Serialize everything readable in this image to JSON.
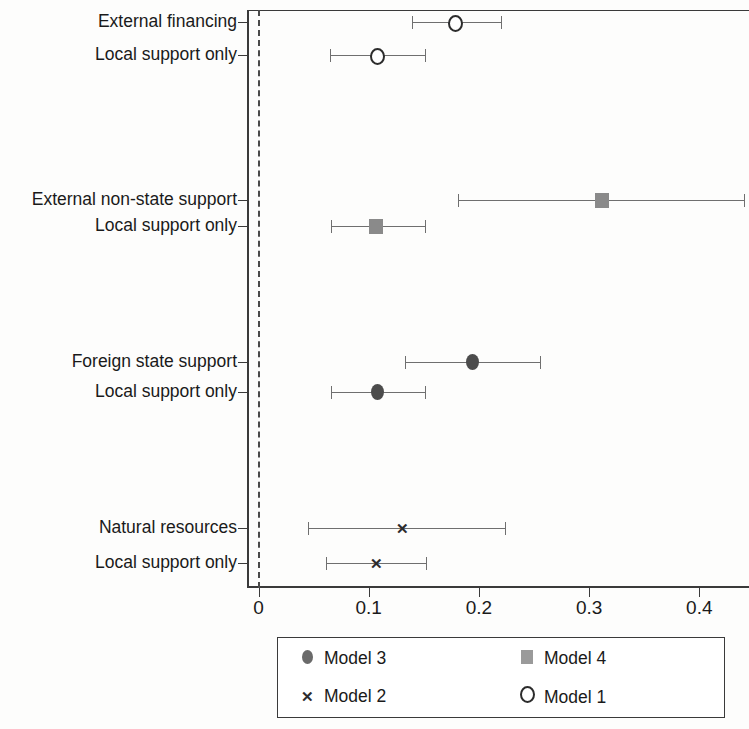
{
  "chart_data": {
    "type": "scatter",
    "title": "",
    "subtitle": "",
    "xlabel": "",
    "ylabel": "",
    "xlim": [
      0.0,
      0.455
    ],
    "grid": false,
    "zero_reference_line": 0.0,
    "x_ticks": [
      {
        "value": 0.0,
        "label": "0"
      },
      {
        "value": 0.1,
        "label": "0.1"
      },
      {
        "value": 0.2,
        "label": "0.2"
      },
      {
        "value": 0.3,
        "label": "0.3"
      },
      {
        "value": 0.4,
        "label": "0.4"
      }
    ],
    "legend": {
      "position": "bottom",
      "entries": [
        {
          "label": "Model 3",
          "marker": "filled-circle",
          "color": "#4c4c4c"
        },
        {
          "label": "Model 4",
          "marker": "filled-square",
          "color": "#8a8a8a"
        },
        {
          "label": "Model 2",
          "marker": "cross",
          "color": "#2c2c2c"
        },
        {
          "label": "Model 1",
          "marker": "open-circle",
          "color": "#2c2c2c"
        }
      ]
    },
    "rows": [
      {
        "label": "External financing",
        "series": "Model 1",
        "marker": "open-circle",
        "estimate": 0.178,
        "ci_low": 0.139,
        "ci_high": 0.22
      },
      {
        "label": "Local support only",
        "series": "Model 1",
        "marker": "open-circle",
        "estimate": 0.107,
        "ci_low": 0.065,
        "ci_high": 0.151
      },
      {
        "label": "External non-state support",
        "series": "Model 4",
        "marker": "filled-square",
        "estimate": 0.312,
        "ci_low": 0.181,
        "ci_high": 0.441
      },
      {
        "label": "Local support only",
        "series": "Model 4",
        "marker": "filled-square",
        "estimate": 0.107,
        "ci_low": 0.066,
        "ci_high": 0.151
      },
      {
        "label": "Foreign state support",
        "series": "Model 3",
        "marker": "filled-circle",
        "estimate": 0.195,
        "ci_low": 0.133,
        "ci_high": 0.255
      },
      {
        "label": "Local support only",
        "series": "Model 3",
        "marker": "filled-circle",
        "estimate": 0.108,
        "ci_low": 0.066,
        "ci_high": 0.151
      },
      {
        "label": "Natural resources",
        "series": "Model 2",
        "marker": "cross",
        "estimate": 0.131,
        "ci_low": 0.045,
        "ci_high": 0.224
      },
      {
        "label": "Local support only",
        "series": "Model 2",
        "marker": "cross",
        "estimate": 0.107,
        "ci_low": 0.061,
        "ci_high": 0.152
      }
    ]
  },
  "layout": {
    "row_y": [
      22,
      55,
      200,
      226,
      362,
      392,
      528,
      563
    ],
    "x0_px": 258.5,
    "px_per_unit": 1102
  }
}
